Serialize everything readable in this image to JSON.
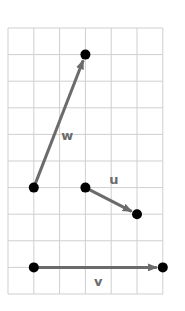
{
  "diagram": {
    "grid": {
      "x0": 8,
      "y0": 28,
      "cols": 6,
      "rows": 10,
      "cell_w": 25.8,
      "cell_h": 26.6,
      "line_color": "#cfcfcf"
    },
    "colors": {
      "vector": "#6b6b6b",
      "point": "#000000",
      "label": "#6b6b6b"
    },
    "vectors": [
      {
        "name": "w",
        "label": "w",
        "start": [
          1,
          6
        ],
        "end": [
          3,
          1
        ],
        "label_pos": [
          2.3,
          4.2
        ]
      },
      {
        "name": "u",
        "label": "u",
        "start": [
          3,
          6
        ],
        "end": [
          5,
          7
        ],
        "label_pos": [
          4.1,
          5.85
        ]
      },
      {
        "name": "v",
        "label": "v",
        "start": [
          1,
          9
        ],
        "end": [
          6,
          9
        ],
        "label_pos": [
          3.5,
          9.7
        ]
      }
    ]
  }
}
